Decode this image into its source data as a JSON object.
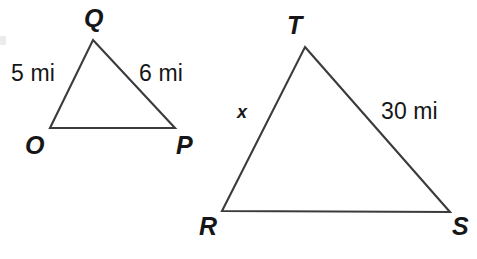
{
  "figure": {
    "background_color": "#ffffff",
    "stroke_color": "#3b3b3d",
    "text_color": "#161618"
  },
  "triangles": [
    {
      "name": "triangle-opq",
      "vertices": [
        {
          "label": "Q",
          "x": 93,
          "y": 40
        },
        {
          "label": "P",
          "x": 175,
          "y": 128
        },
        {
          "label": "O",
          "x": 50,
          "y": 128
        }
      ],
      "vertex_labels": [
        {
          "name": "vertex-label-q",
          "text": "Q",
          "left": 84,
          "top": 6
        },
        {
          "name": "vertex-label-o",
          "text": "O",
          "left": 25,
          "top": 133
        },
        {
          "name": "vertex-label-p",
          "text": "P",
          "left": 176,
          "top": 133
        }
      ],
      "side_labels": [
        {
          "name": "side-label-oq",
          "text": "5 mi",
          "left": 11,
          "top": 62
        },
        {
          "name": "side-label-qp",
          "text": "6 mi",
          "left": 139,
          "top": 62
        }
      ]
    },
    {
      "name": "triangle-rst",
      "vertices": [
        {
          "label": "T",
          "x": 305,
          "y": 47
        },
        {
          "label": "S",
          "x": 450,
          "y": 212
        },
        {
          "label": "R",
          "x": 222,
          "y": 211
        }
      ],
      "vertex_labels": [
        {
          "name": "vertex-label-t",
          "text": "T",
          "left": 287,
          "top": 13
        },
        {
          "name": "vertex-label-r",
          "text": "R",
          "left": 199,
          "top": 214
        },
        {
          "name": "vertex-label-s",
          "text": "S",
          "left": 452,
          "top": 214
        }
      ],
      "side_labels": [
        {
          "name": "side-label-rt",
          "text": "x",
          "left": 237,
          "top": 103
        },
        {
          "name": "side-label-ts",
          "text": "30 mi",
          "left": 381,
          "top": 100
        }
      ]
    }
  ]
}
